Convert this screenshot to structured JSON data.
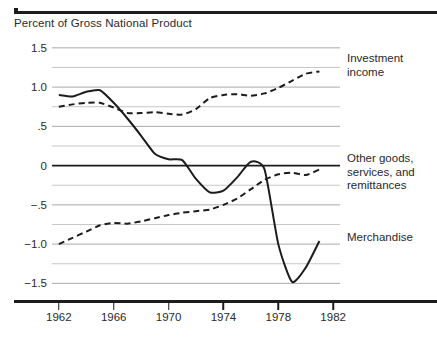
{
  "figure": {
    "axis_title": "Percent of Gross National Product",
    "background_color": "#ffffff",
    "line_color": "#1c1c1c",
    "grid_color": "#b9b9b9"
  },
  "chart_data": {
    "type": "line",
    "title": "Percent of Gross National Product",
    "xlabel": "",
    "ylabel": "Percent of Gross National Product",
    "xlim": [
      1961.5,
      1982.5
    ],
    "ylim": [
      -1.75,
      1.6
    ],
    "grid": true,
    "grid_minor_step": 0.25,
    "legend_position": "right-inline",
    "x_ticks": [
      1962,
      1966,
      1970,
      1974,
      1978,
      1982
    ],
    "x_tick_labels": [
      "1962",
      "1966",
      "1970",
      "1974",
      "1978",
      "1982"
    ],
    "y_ticks": [
      1.5,
      1.0,
      0.5,
      0.0,
      -0.5,
      -1.0,
      -1.5
    ],
    "y_tick_labels": [
      "1.5",
      "1.0",
      ".5",
      "0",
      "−.5",
      "−1.0",
      "−1.5"
    ],
    "x": [
      1962,
      1963,
      1964,
      1965,
      1966,
      1967,
      1968,
      1969,
      1970,
      1971,
      1972,
      1973,
      1974,
      1975,
      1976,
      1977,
      1978,
      1979,
      1980,
      1981
    ],
    "series": [
      {
        "name": "Investment income",
        "label": "Investment\nincome",
        "style": "dashed",
        "values": [
          0.75,
          0.78,
          0.8,
          0.8,
          0.74,
          0.67,
          0.67,
          0.68,
          0.66,
          0.65,
          0.72,
          0.86,
          0.9,
          0.91,
          0.89,
          0.92,
          0.99,
          1.08,
          1.17,
          1.2
        ]
      },
      {
        "name": "Other goods, services, and remittances",
        "label": "Other goods,\nservices, and\nremittances",
        "style": "dashed",
        "values": [
          -1.0,
          -0.92,
          -0.84,
          -0.76,
          -0.73,
          -0.74,
          -0.71,
          -0.67,
          -0.63,
          -0.6,
          -0.58,
          -0.56,
          -0.5,
          -0.42,
          -0.3,
          -0.18,
          -0.11,
          -0.09,
          -0.12,
          -0.05
        ]
      },
      {
        "name": "Merchandise",
        "label": "Merchandise",
        "style": "solid",
        "values": [
          0.9,
          0.88,
          0.94,
          0.96,
          0.8,
          0.6,
          0.38,
          0.15,
          0.08,
          0.07,
          -0.17,
          -0.34,
          -0.32,
          -0.15,
          0.05,
          -0.05,
          -1.0,
          -1.48,
          -1.3,
          -0.96
        ]
      }
    ]
  },
  "series_labels": {
    "investment_income_line1": "Investment",
    "investment_income_line2": "income",
    "other_goods_line1": "Other goods,",
    "other_goods_line2": "services, and",
    "other_goods_line3": "remittances",
    "merchandise": "Merchandise"
  }
}
